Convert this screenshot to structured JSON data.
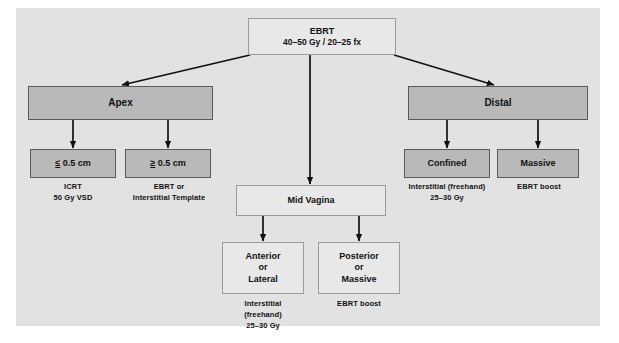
{
  "diagram": {
    "colors": {
      "panel_bg": "#e2e2e2",
      "gray_box_fill": "#b9b9b9",
      "gray_box_border": "#5a5a5a",
      "light_box_fill": "#e8e8e8",
      "light_box_border": "#9a9a9a",
      "arrow": "#111111",
      "text": "#111111"
    },
    "nodes": {
      "root": {
        "line1": "EBRT",
        "line2": "40–50 Gy / 20–25 fx",
        "style": "light"
      },
      "apex": {
        "label": "Apex",
        "style": "gray"
      },
      "mid_vagina": {
        "label": "Mid Vagina",
        "style": "light"
      },
      "distal": {
        "label": "Distal",
        "style": "gray"
      },
      "apex_small": {
        "prefix": "≤",
        "label": " 0.5 cm",
        "style": "gray"
      },
      "apex_large": {
        "prefix": "≥",
        "label": " 0.5 cm",
        "style": "gray"
      },
      "anterior_lateral": {
        "line1": "Anterior",
        "line2": "or",
        "line3": "Lateral",
        "style": "light"
      },
      "posterior_massive": {
        "line1": "Posterior",
        "line2": "or",
        "line3": "Massive",
        "style": "light"
      },
      "confined": {
        "label": "Confined",
        "style": "gray"
      },
      "massive": {
        "label": "Massive",
        "style": "gray"
      }
    },
    "captions": {
      "apex_small": {
        "line1": "ICRT",
        "line2": "50 Gy VSD"
      },
      "apex_large": {
        "line1": "EBRT or",
        "line2": "Interstitial Template"
      },
      "anterior_lateral": {
        "line1": "Interstitial",
        "line2": "(freehand)",
        "line3": "25–30 Gy"
      },
      "posterior_massive": {
        "line1": "EBRT boost"
      },
      "confined": {
        "line1": "Interstitial (freehand)",
        "line2": "25–30 Gy"
      },
      "massive": {
        "line1": "EBRT boost"
      }
    }
  }
}
